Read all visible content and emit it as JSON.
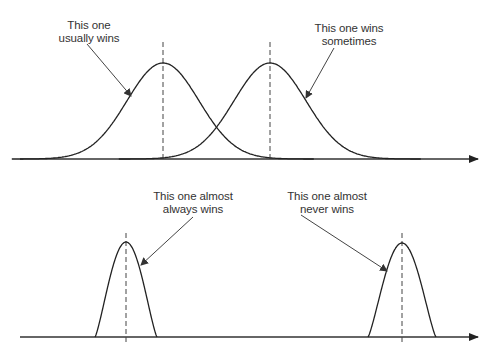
{
  "colors": {
    "curve": "#222222",
    "axis": "#333333",
    "dashed": "#444444",
    "arrow": "#444444",
    "text": "#333333",
    "background": "#ffffff"
  },
  "panels": [
    {
      "id": "top",
      "axis": {
        "y": 159,
        "x_start": 20,
        "x_end": 478
      },
      "curves": [
        {
          "name": "left-distribution",
          "mean_x": 163,
          "peak_y": 63,
          "sigma": 36,
          "base_y": 159
        },
        {
          "name": "right-distribution",
          "mean_x": 270,
          "peak_y": 63,
          "sigma": 36,
          "base_y": 159
        }
      ],
      "dashed_lines": [
        {
          "x": 163,
          "y_top": 42,
          "y_bottom": 159
        },
        {
          "x": 270,
          "y_top": 42,
          "y_bottom": 159
        }
      ],
      "annotations": [
        {
          "lines": [
            "This one",
            "usually wins"
          ],
          "x": 89,
          "y": 19,
          "arrow": {
            "x1": 87,
            "y1": 44,
            "x2": 131,
            "y2": 96
          }
        },
        {
          "lines": [
            "This one wins",
            "sometimes"
          ],
          "x": 349,
          "y": 22,
          "arrow": {
            "x1": 334,
            "y1": 48,
            "x2": 306,
            "y2": 98
          }
        }
      ]
    },
    {
      "id": "bottom",
      "axis": {
        "y": 337,
        "x_start": 20,
        "x_end": 478
      },
      "curves": [
        {
          "name": "narrow-left-distribution",
          "mean_x": 126,
          "peak_y": 242,
          "half_width": 31,
          "base_y": 337
        },
        {
          "name": "narrow-right-distribution",
          "mean_x": 402,
          "peak_y": 243,
          "half_width": 34,
          "base_y": 337
        }
      ],
      "dashed_lines": [
        {
          "x": 126,
          "y_top": 233,
          "y_bottom": 345
        },
        {
          "x": 402,
          "y_top": 233,
          "y_bottom": 345
        }
      ],
      "annotations": [
        {
          "lines": [
            "This one almost",
            "always wins"
          ],
          "x": 193,
          "y": 190,
          "arrow": {
            "x1": 193,
            "y1": 217,
            "x2": 141,
            "y2": 265
          }
        },
        {
          "lines": [
            "This one almost",
            "never wins"
          ],
          "x": 327,
          "y": 190,
          "arrow": {
            "x1": 301,
            "y1": 215,
            "x2": 387,
            "y2": 271
          }
        }
      ]
    }
  ],
  "labels": {
    "usually_wins": [
      "This one",
      "usually wins"
    ],
    "wins_sometimes": [
      "This one wins",
      "sometimes"
    ],
    "almost_always_wins": [
      "This one almost",
      "always wins"
    ],
    "almost_never_wins": [
      "This one almost",
      "never wins"
    ]
  }
}
